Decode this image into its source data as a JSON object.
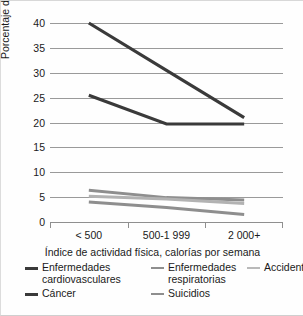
{
  "chart_data": {
    "type": "line",
    "title": "",
    "xlabel": "Índice de actividad física, calorías por semana",
    "ylabel": "Porcentaje de muertes",
    "categories": [
      "< 500",
      "500-1 999",
      "2 000+"
    ],
    "ylim": [
      0,
      40
    ],
    "yticks": [
      0,
      5,
      10,
      15,
      20,
      25,
      30,
      35,
      40
    ],
    "grid": true,
    "legend_position": "bottom",
    "series": [
      {
        "name": "Enfermedades cardiovasculares",
        "values": [
          40.0,
          30.5,
          21.0
        ],
        "color": "#3a3a3a",
        "width": 3.2
      },
      {
        "name": "Cáncer",
        "values": [
          25.5,
          19.7,
          19.7
        ],
        "color": "#3a3a3a",
        "width": 3.2
      },
      {
        "name": "Enfermedades respiratorias",
        "values": [
          6.4,
          4.9,
          4.4
        ],
        "color": "#8e8e8e",
        "width": 3.0
      },
      {
        "name": "Accidentes",
        "values": [
          5.2,
          4.6,
          3.7
        ],
        "color": "#b2b2b2",
        "width": 3.0
      },
      {
        "name": "Suicidios",
        "values": [
          4.0,
          2.9,
          1.5
        ],
        "color": "#8e8e8e",
        "width": 3.0
      }
    ]
  },
  "axis": {
    "y_title": "Porcentaje de muertes",
    "x_title": "Índice de actividad física, calorías por semana",
    "y_ticks": [
      "40",
      "35",
      "30",
      "25",
      "20",
      "15",
      "10",
      "5",
      "0"
    ],
    "x_ticks": [
      "< 500",
      "500-1 999",
      "2 000+"
    ]
  },
  "legend": {
    "items": [
      {
        "label": "Enfermedades\ncardiovasculares",
        "color": "#3a3a3a",
        "thickness": "3px"
      },
      {
        "label": "Enfermedades\nrespiratorias",
        "color": "#8e8e8e",
        "thickness": "2.5px"
      },
      {
        "label": "Accidentes",
        "color": "#b9b9b9",
        "thickness": "2px"
      },
      {
        "label": "Cáncer",
        "color": "#3a3a3a",
        "thickness": "3px"
      },
      {
        "label": "Suicidios",
        "color": "#8e8e8e",
        "thickness": "2.5px"
      }
    ]
  }
}
